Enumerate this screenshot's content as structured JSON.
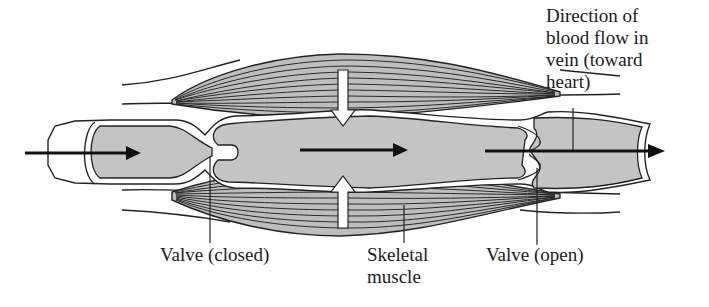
{
  "diagram": {
    "colors": {
      "background": "#ffffff",
      "blood_fill": "#c4c4c4",
      "muscle_fill": "#bdbdbd",
      "outline": "#1a1a1a",
      "vein_wall": "#ffffff"
    },
    "labels": {
      "direction": {
        "lines": [
          "Direction of",
          "blood flow in",
          "vein (toward",
          "heart)"
        ]
      },
      "valve_closed": {
        "lines": [
          "Valve (closed)"
        ]
      },
      "skeletal_muscle": {
        "lines": [
          "Skeletal",
          "muscle"
        ]
      },
      "valve_open": {
        "lines": [
          "Valve (open)"
        ]
      }
    },
    "arrows": [
      {
        "name": "inflow-arrow",
        "direction": "right",
        "style": "black"
      },
      {
        "name": "middle-flow-arrow",
        "direction": "right",
        "style": "black"
      },
      {
        "name": "outflow-arrow",
        "direction": "right",
        "style": "black"
      },
      {
        "name": "muscle-compression-arrow-top",
        "direction": "down",
        "style": "white"
      },
      {
        "name": "muscle-compression-arrow-bottom",
        "direction": "up",
        "style": "white"
      }
    ]
  }
}
